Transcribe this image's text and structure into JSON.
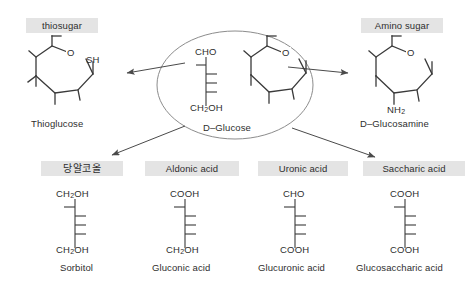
{
  "diagram": {
    "center": {
      "name": "D-Glucose",
      "label": "D–Glucose",
      "fischer": {
        "top": "CHO",
        "bottom": "CH₂OH",
        "ticks": [
          "left",
          "right",
          "right",
          "right"
        ]
      },
      "haworth": {
        "ring_heteroatom": "O",
        "substituent": ""
      }
    },
    "branches": [
      {
        "id": "thiosugar",
        "chip": "thiosugar",
        "chip_korean": false,
        "caption": "Thioglucose",
        "structure": "haworth",
        "ring_heteroatom": "O",
        "substituent": "SH"
      },
      {
        "id": "amino-sugar",
        "chip": "Amino sugar",
        "chip_korean": false,
        "caption": "D–Glucosamine",
        "structure": "haworth",
        "ring_heteroatom": "O",
        "substituent": "NH₂"
      },
      {
        "id": "sugar-alcohol",
        "chip": "당알코올",
        "chip_korean": true,
        "caption": "Sorbitol",
        "structure": "fischer",
        "top": "CH₂OH",
        "bottom": "CH₂OH",
        "ticks": [
          "left",
          "right",
          "right",
          "right"
        ]
      },
      {
        "id": "aldonic-acid",
        "chip": "Aldonic acid",
        "chip_korean": false,
        "caption": "Gluconic acid",
        "structure": "fischer",
        "top": "COOH",
        "bottom": "CH₂OH",
        "ticks": [
          "left",
          "right",
          "right",
          "right"
        ]
      },
      {
        "id": "uronic-acid",
        "chip": "Uronic acid",
        "chip_korean": false,
        "caption": "Glucuronic acid",
        "structure": "fischer",
        "top": "CHO",
        "bottom": "COOH",
        "ticks": [
          "left",
          "right",
          "right",
          "right"
        ]
      },
      {
        "id": "saccharic-acid",
        "chip": "Saccharic acid",
        "chip_korean": false,
        "caption": "Glucosaccharic acid",
        "structure": "fischer",
        "top": "COOH",
        "bottom": "COOH",
        "ticks": [
          "left",
          "right",
          "right",
          "right"
        ]
      }
    ],
    "colors": {
      "chip_background": "#e4e4e4",
      "text": "#2e2e2e",
      "stroke": "#3a3a3a",
      "ellipse_stroke": "#8c8c8c",
      "arrow": "#4a4a4a",
      "background": "#ffffff"
    },
    "arrows": [
      {
        "id": "arrow-to-thiosugar",
        "from": "center",
        "to": "thiosugar"
      },
      {
        "id": "arrow-to-amino-sugar",
        "from": "center",
        "to": "amino-sugar"
      },
      {
        "id": "arrow-to-sugar-alcohol",
        "from": "center",
        "to": "sugar-alcohol"
      },
      {
        "id": "arrow-to-saccharic-acid",
        "from": "center",
        "to": "saccharic-acid"
      }
    ]
  }
}
